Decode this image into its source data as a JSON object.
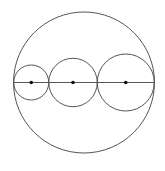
{
  "diagram": {
    "type": "geometry",
    "stroke_color": "#555555",
    "dot_color": "#111111",
    "outer_circle": {
      "cx": 84,
      "cy": 82.5,
      "r": 70.5
    },
    "diameter_line": {
      "x1": 13.5,
      "y1": 82.5,
      "x2": 154.5,
      "y2": 82.5
    },
    "inner_circles": [
      {
        "cx": 31.25,
        "cy": 82.5,
        "r": 17.5,
        "center_dot": true
      },
      {
        "cx": 73,
        "cy": 82.5,
        "r": 24.25,
        "center_dot": true
      },
      {
        "cx": 125.75,
        "cy": 82.5,
        "r": 28.5,
        "center_dot": true
      }
    ],
    "tangent_points_x": [
      13.5,
      48.75,
      97.25,
      154.25
    ]
  }
}
